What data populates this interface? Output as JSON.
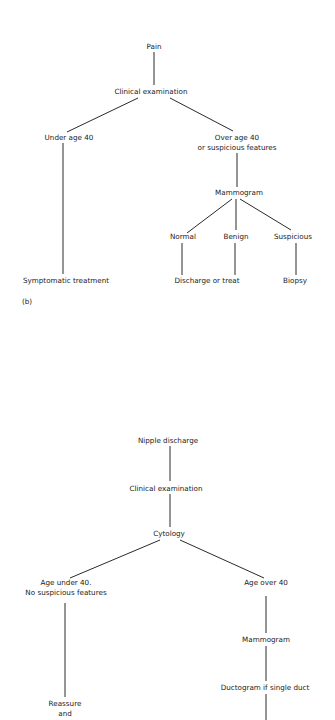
{
  "diagram_a": {
    "title": "Pain flowchart",
    "panel_label": "(b)",
    "nodes": {
      "pain": "Pain",
      "clinical_exam": "Clinical examination",
      "under_40": "Under age 40",
      "over_40_line1": "Over age 40",
      "over_40_line2": "or suspicious features",
      "mammogram": "Mammogram",
      "normal": "Normal",
      "benign": "Benign",
      "suspicious": "Suspicious",
      "symptomatic_treatment": "Symptomatic treatment",
      "discharge_or_treat": "Discharge or treat",
      "biopsy": "Biopsy"
    }
  },
  "diagram_b": {
    "title": "Nipple discharge flowchart",
    "nodes": {
      "nipple_discharge": "Nipple discharge",
      "clinical_exam": "Clinical examination",
      "cytology": "Cytology",
      "age_under_40_line1": "Age under 40.",
      "age_under_40_line2": "No suspicious features",
      "age_over_40": "Age over 40",
      "mammogram": "Mammogram",
      "ductogram": "Ductogram if single duct",
      "reassure_line1": "Reassure",
      "reassure_line2": "and"
    }
  }
}
